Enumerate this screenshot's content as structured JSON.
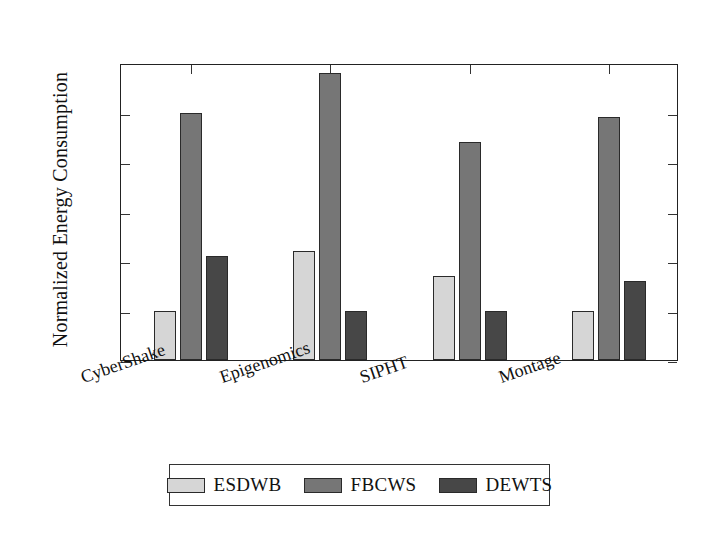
{
  "chart_data": {
    "type": "bar",
    "title": "",
    "subtitle": "",
    "xlabel": "",
    "ylabel": "Normalized Energy Consumption",
    "categories": [
      "CyberShake",
      "Epigenomics",
      "SIPHT",
      "Montage"
    ],
    "series": [
      {
        "name": "ESDWB",
        "color": "#d6d6d6",
        "values": [
          1.0,
          1.12,
          1.07,
          1.0
        ]
      },
      {
        "name": "FBCWS",
        "color": "#767676",
        "values": [
          1.4,
          1.48,
          1.34,
          1.39
        ]
      },
      {
        "name": "DEWTS",
        "color": "#474747",
        "values": [
          1.11,
          1.0,
          1.0,
          1.06
        ]
      }
    ],
    "ylim": [
      0.9,
      1.5
    ],
    "yticks": [
      "0.9",
      "1.0",
      "1.1",
      "1.2",
      "1.3",
      "1.4"
    ],
    "ytick_values": [
      0.9,
      1.0,
      1.1,
      1.2,
      1.3,
      1.4
    ],
    "grid": false,
    "legend_position": "below-center",
    "legend_entries": [
      "ESDWB",
      "FBCWS",
      "DEWTS"
    ],
    "annotations": []
  },
  "legend": {
    "items": [
      {
        "label": "ESDWB",
        "swatch_name": "legend-swatch-esdwb"
      },
      {
        "label": "FBCWS",
        "swatch_name": "legend-swatch-fbcws"
      },
      {
        "label": "DEWTS",
        "swatch_name": "legend-swatch-dewts"
      }
    ]
  }
}
